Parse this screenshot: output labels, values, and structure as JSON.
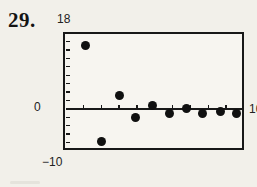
{
  "problem": {
    "number": "29."
  },
  "colors": {
    "ink": "#181818",
    "paper": "#f2f0ea",
    "plot_bg": "#f7f5f0"
  },
  "chart_data": {
    "type": "scatter",
    "title": "",
    "xlabel": "",
    "ylabel": "",
    "xlim": [
      0,
      10
    ],
    "ylim": [
      -10,
      18
    ],
    "grid": false,
    "legend": null,
    "axis_labels": {
      "y_top": "18",
      "y_zero": "0",
      "y_bottom": "−10",
      "x_right": "10"
    },
    "x_ticks": [
      1,
      2,
      3,
      4,
      5,
      6,
      7,
      8,
      9
    ],
    "y_ticks": [
      -8,
      -6,
      -4,
      -2,
      2,
      4,
      6,
      8,
      10,
      12,
      14,
      16
    ],
    "points": [
      {
        "x": 1.1,
        "y": 15.0
      },
      {
        "x": 2.0,
        "y": -7.8
      },
      {
        "x": 3.0,
        "y": 3.3
      },
      {
        "x": 3.9,
        "y": -2.1
      },
      {
        "x": 4.9,
        "y": 0.8
      },
      {
        "x": 5.8,
        "y": -1.1
      },
      {
        "x": 6.8,
        "y": 0.1
      },
      {
        "x": 7.7,
        "y": -1.0
      },
      {
        "x": 8.7,
        "y": -0.5
      },
      {
        "x": 9.6,
        "y": -1.0
      }
    ]
  }
}
